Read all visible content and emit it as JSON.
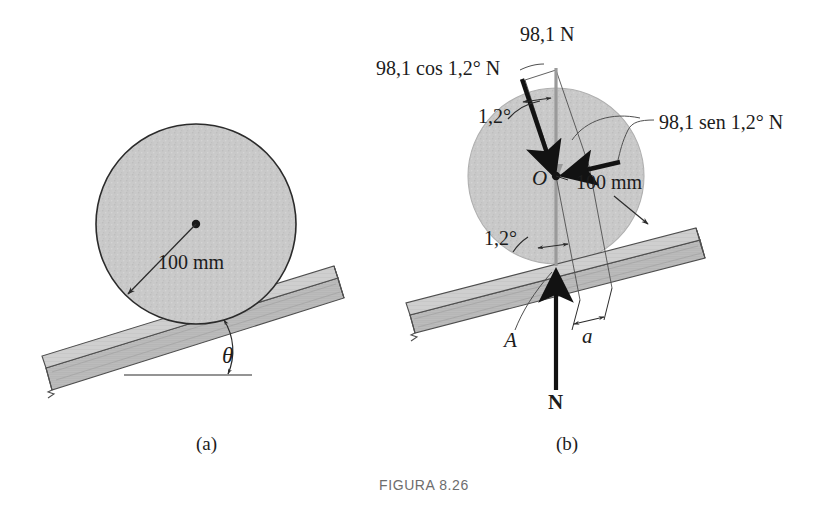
{
  "figure": {
    "caption": "FIGURA 8.26",
    "panels": [
      {
        "id": "a",
        "label": "(a)"
      },
      {
        "id": "b",
        "label": "(b)"
      }
    ]
  },
  "panel_a": {
    "radius_label": "100 mm",
    "angle_label": "θ",
    "description": "Cylinder of 100 mm radius resting on an inclined plank at angle theta"
  },
  "panel_b": {
    "weight_label": "98,1 N",
    "cos_component_label": "98,1 cos 1,2° N",
    "sin_component_label": "98,1 sen 1,2° N",
    "angle_upper_label": "1,2°",
    "angle_lower_label": "1,2°",
    "center_label": "O",
    "radius_label": "100 mm",
    "contact_point_label": "A",
    "moment_arm_label": "a",
    "normal_force_label": "N",
    "description": "Free-body diagram: weight 98,1 N resolved into components, normal force N at contact point A, moment arm a"
  },
  "colors": {
    "disk_fill": "#c9c9c9",
    "disk_outline": "#2b2b2b",
    "plank_fill": "#b8b8b8",
    "plank_outline": "#4a4a4a",
    "force_arrow": "#1c1c1c",
    "thin_line": "#555555",
    "text": "#1c1c1c",
    "caption_text": "#6d6d6d",
    "page_bg": "#ffffff"
  },
  "geometry": {
    "panel_a": {
      "disk_center": [
        196,
        224
      ],
      "disk_radius": 100,
      "incline_angle_deg": 17
    },
    "panel_b": {
      "disk_center": [
        556,
        176
      ],
      "disk_radius": 88,
      "contact_point": [
        556,
        266
      ],
      "incline_angle_deg": 13,
      "resolved_angle_deg": 1.2
    }
  }
}
